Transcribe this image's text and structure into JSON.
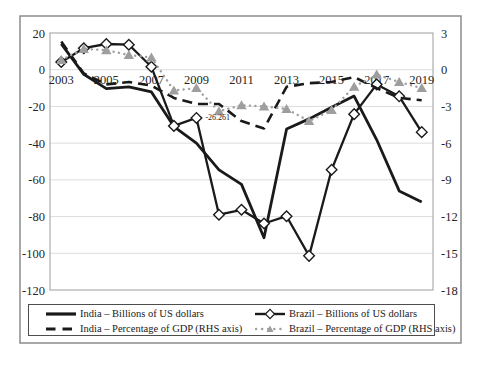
{
  "figure": {
    "border_color": "#848484",
    "plot_border_color": "#a6a6a6",
    "gridline_color": "#dcdcdc"
  },
  "chart_data": {
    "type": "line",
    "x": [
      2003,
      2004,
      2005,
      2006,
      2007,
      2008,
      2009,
      2010,
      2011,
      2012,
      2013,
      2014,
      2015,
      2016,
      2017,
      2018,
      2019
    ],
    "x_axis": {
      "tick_labels": [
        "2003",
        "2005",
        "2007",
        "2009",
        "2011",
        "2013",
        "2015",
        "2017",
        "2019"
      ]
    },
    "left_axis": {
      "ticks": [
        20,
        0,
        -20,
        -40,
        -60,
        -80,
        -100,
        -120
      ],
      "max": 20,
      "min": -120
    },
    "right_axis": {
      "ticks": [
        3,
        0,
        -3,
        -6,
        -9,
        -12,
        -15,
        -18
      ],
      "max": 3,
      "min": -18
    },
    "grid": true,
    "legend_position": "bottom",
    "series": [
      {
        "id": "india_usd",
        "name": "India – Billions of US dollars",
        "axis": "left",
        "color": "#1a1a1a",
        "line": "solid",
        "marker": "none",
        "values": [
          14.1,
          -2.5,
          -10.3,
          -9.3,
          -12.1,
          -31.0,
          -40.0,
          -54.5,
          -62.5,
          -91.5,
          -32.3,
          -26.8,
          -20.5,
          -14.4,
          -38.2,
          -66.0,
          -72.0
        ]
      },
      {
        "id": "brazil_usd",
        "name": "Brazil – Billions of US dollars",
        "axis": "left",
        "color": "#1a1a1a",
        "line": "solid",
        "marker": "diamond",
        "values": [
          4.2,
          11.7,
          14.0,
          13.6,
          1.6,
          -30.6,
          -26.261,
          -79.0,
          -76.3,
          -83.8,
          -79.8,
          -101.4,
          -54.5,
          -24.2,
          -8.0,
          -14.5,
          -34.0
        ]
      },
      {
        "id": "india_pct",
        "name": "India – Percentage of GDP (RHS axis)",
        "axis": "right",
        "color": "#1a1a1a",
        "line": "dashed",
        "marker": "none",
        "values": [
          2.3,
          -0.3,
          -1.2,
          -1.0,
          -1.3,
          -2.3,
          -2.8,
          -2.8,
          -4.2,
          -4.8,
          -1.4,
          -1.1,
          -1.0,
          -0.6,
          -1.5,
          -2.3,
          -2.5
        ]
      },
      {
        "id": "brazil_pct",
        "name": "Brazil – Percentage of GDP (RHS axis)",
        "axis": "right",
        "color": "#9e9e9e",
        "line": "dotted",
        "marker": "triangle",
        "values": [
          0.8,
          1.7,
          1.6,
          1.2,
          1.0,
          -1.7,
          -1.5,
          -3.4,
          -2.9,
          -3.0,
          -3.2,
          -4.2,
          -3.3,
          -1.4,
          -0.4,
          -1.0,
          -1.5
        ]
      }
    ],
    "annotations": [
      {
        "text": "-26.261",
        "series_id": "brazil_usd",
        "year": 2009,
        "value": -26.261
      }
    ]
  }
}
